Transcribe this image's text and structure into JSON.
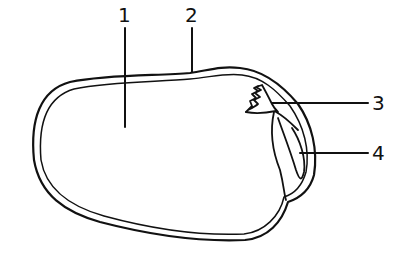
{
  "diagram": {
    "labels": [
      {
        "id": "1",
        "text": "1"
      },
      {
        "id": "2",
        "text": "2"
      },
      {
        "id": "3",
        "text": "3"
      },
      {
        "id": "4",
        "text": "4"
      }
    ],
    "colors": {
      "line": "#111111",
      "background": "#ffffff"
    }
  }
}
